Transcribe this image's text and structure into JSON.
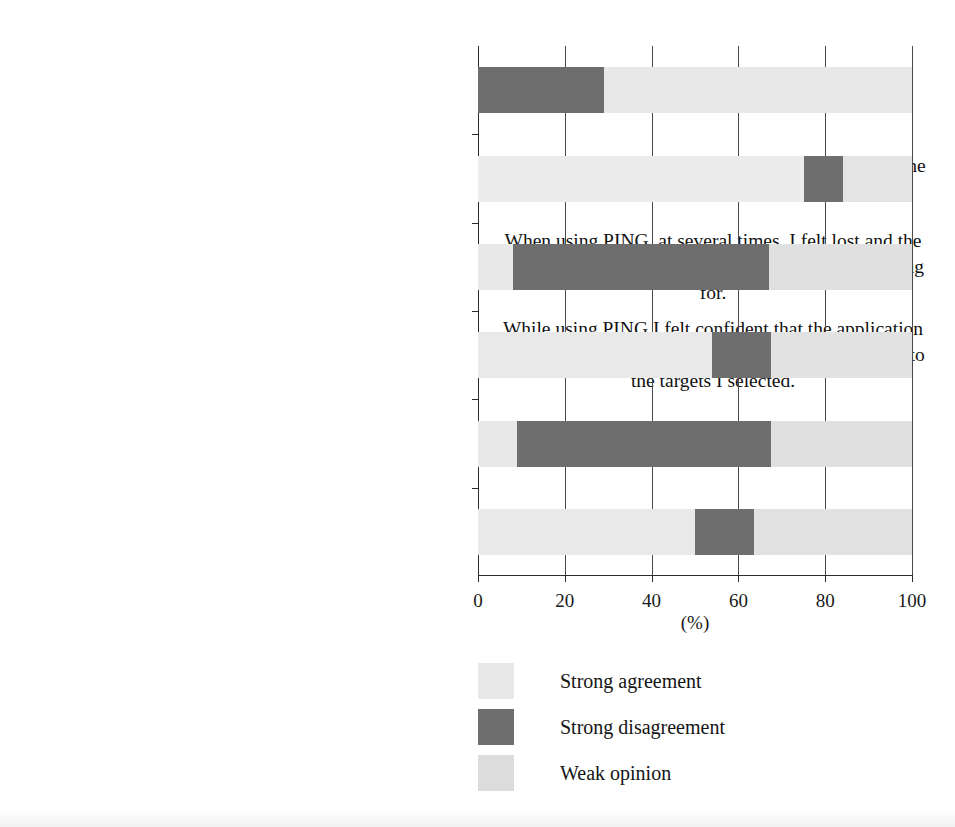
{
  "chart_data": {
    "type": "bar",
    "orientation": "horizontal",
    "stacked": true,
    "title": "",
    "xlabel": "(%)",
    "ylabel": "",
    "xlim": [
      0,
      100
    ],
    "xticks": [
      0,
      20,
      40,
      60,
      80,
      100
    ],
    "xtick_labels": [
      "0",
      "20",
      "40",
      "60",
      "80",
      "100"
    ],
    "grid": true,
    "legend_position": "bottom-center",
    "colors": {
      "strong_agreement": "#e8e8e8",
      "strong_disagreement": "#6e6e6e",
      "weak_opinion": "#dcdcdc",
      "axis": "#2b2b2b",
      "text": "#111111",
      "background": "#ffffff"
    },
    "legend": [
      {
        "label": "Strong agreement",
        "color": "#e8e8e8"
      },
      {
        "label": "Strong disagreement",
        "color": "#6e6e6e"
      },
      {
        "label": "Weak opinion",
        "color": "#dcdcdc"
      }
    ],
    "categories": [
      "The sound of feedback from the PING application was frustrating and confusing.",
      "I would like to explore other cities with the help of the PING application.",
      "When using PING, at several times, I felt lost and the application could not help me find what I was looking for.",
      "While using PING I felt confident that the application would guide me correctly and help me find my way to the targets I selected.",
      "The PING application made me feel stressed while moving through the city.",
      "I felt secure and comfortable when using the PING application."
    ],
    "series": [
      {
        "name": "Strong agreement",
        "color": "#e8e8e8",
        "values": [
          0,
          75,
          8,
          54,
          9,
          50
        ]
      },
      {
        "name": "Strong disagreement",
        "color": "#6e6e6e",
        "values": [
          29,
          9,
          59,
          13.5,
          58.5,
          13.5
        ]
      },
      {
        "name": "Weak opinion",
        "color": "#dcdcdc",
        "values": [
          71,
          16,
          33,
          32.5,
          32.5,
          36.5
        ]
      }
    ],
    "bars": [
      {
        "category": "The sound of feedback from the PING application was frustrating and confusing.",
        "label_lines": [
          "The sound of feedback from the PING application",
          "was frustrating and confusing."
        ],
        "segments": [
          {
            "name": "Strong disagreement",
            "start": 0,
            "end": 29,
            "color": "#6e6e6e"
          },
          {
            "name": "Strong agreement",
            "start": 29,
            "end": 100,
            "color": "#e8e8e8"
          }
        ]
      },
      {
        "category": "I would like to explore other cities with the help of the PING application.",
        "label_lines": [
          "I would like to explore other cities with the help of the",
          "PING application."
        ],
        "segments": [
          {
            "name": "Strong agreement",
            "start": 0,
            "end": 75,
            "color": "#ececec"
          },
          {
            "name": "Strong disagreement",
            "start": 75,
            "end": 84,
            "color": "#6e6e6e"
          },
          {
            "name": "Weak opinion",
            "start": 84,
            "end": 100,
            "color": "#e4e4e4"
          }
        ]
      },
      {
        "category": "When using PING, at several times, I felt lost and the application could not help me find what I was looking for.",
        "label_lines": [
          "When using PING, at several times, I felt lost and the",
          "application could not help me find what I was looking",
          "for."
        ],
        "segments": [
          {
            "name": "Strong agreement",
            "start": 0,
            "end": 8,
            "color": "#e8e8e8"
          },
          {
            "name": "Strong disagreement",
            "start": 8,
            "end": 67,
            "color": "#6e6e6e"
          },
          {
            "name": "Weak opinion",
            "start": 67,
            "end": 100,
            "color": "#e0e0e0"
          }
        ]
      },
      {
        "category": "While using PING I felt confident that the application would guide me correctly and help me find my way to the targets I selected.",
        "label_lines": [
          "While using PING I felt confident that the application",
          "would guide me correctly and help me find my way to",
          "the targets I selected."
        ],
        "segments": [
          {
            "name": "Strong agreement",
            "start": 0,
            "end": 54,
            "color": "#e9e9e9"
          },
          {
            "name": "Strong disagreement",
            "start": 54,
            "end": 67.5,
            "color": "#6e6e6e"
          },
          {
            "name": "Weak opinion",
            "start": 67.5,
            "end": 100,
            "color": "#e2e2e2"
          }
        ]
      },
      {
        "category": "The PING application made me feel stressed while moving through the city.",
        "label_lines": [
          "The PING application made me feel stressed while",
          "moving through the city."
        ],
        "segments": [
          {
            "name": "Strong agreement",
            "start": 0,
            "end": 9,
            "color": "#e8e8e8"
          },
          {
            "name": "Strong disagreement",
            "start": 9,
            "end": 67.5,
            "color": "#6e6e6e"
          },
          {
            "name": "Weak opinion",
            "start": 67.5,
            "end": 100,
            "color": "#e0e0e0"
          }
        ]
      },
      {
        "category": "I felt secure and comfortable when using the PING application.",
        "label_lines": [
          "I felt secure and comfortable when using the PING",
          "application."
        ],
        "segments": [
          {
            "name": "Strong agreement",
            "start": 0,
            "end": 50,
            "color": "#e9e9e9"
          },
          {
            "name": "Strong disagreement",
            "start": 50,
            "end": 63.5,
            "color": "#6e6e6e"
          },
          {
            "name": "Weak opinion",
            "start": 63.5,
            "end": 100,
            "color": "#e1e1e1"
          }
        ]
      }
    ]
  },
  "axis": {
    "unit_label": "(%)"
  }
}
